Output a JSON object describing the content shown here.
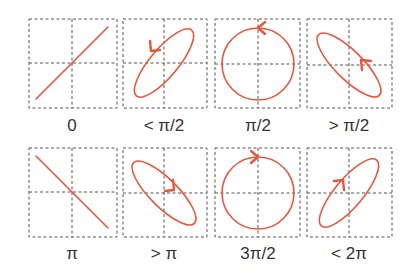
{
  "colors": {
    "curve": "#e8553e",
    "grid": "#555555",
    "label": "#333333"
  },
  "panels": [
    {
      "label": "0",
      "phase": "0",
      "shape": "line",
      "direction": "up-right",
      "arrow": "none"
    },
    {
      "label": "< π/2",
      "phase": "<pi/2",
      "shape": "ellipse",
      "direction": "up-right",
      "arrow": "counterclockwise"
    },
    {
      "label": "π/2",
      "phase": "pi/2",
      "shape": "circle",
      "direction": "none",
      "arrow": "counterclockwise"
    },
    {
      "label": "> π/2",
      "phase": ">pi/2",
      "shape": "ellipse",
      "direction": "down-right",
      "arrow": "counterclockwise"
    },
    {
      "label": "π",
      "phase": "pi",
      "shape": "line",
      "direction": "down-right",
      "arrow": "none"
    },
    {
      "label": "> π",
      "phase": ">pi",
      "shape": "ellipse",
      "direction": "down-right",
      "arrow": "clockwise"
    },
    {
      "label": "3π/2",
      "phase": "3pi/2",
      "shape": "circle",
      "direction": "none",
      "arrow": "clockwise"
    },
    {
      "label": "< 2π",
      "phase": "<2pi",
      "shape": "ellipse",
      "direction": "up-right",
      "arrow": "clockwise"
    }
  ]
}
